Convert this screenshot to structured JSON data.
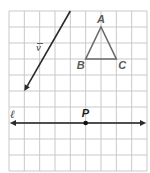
{
  "figure": {
    "grid": {
      "columns": 9,
      "rows": 10
    },
    "vector": {
      "label": "v",
      "tail": [
        4,
        0
      ],
      "head": [
        1,
        5
      ]
    },
    "triangle": {
      "vertices": [
        {
          "name": "A",
          "point": [
            6,
            1
          ]
        },
        {
          "name": "B",
          "point": [
            5,
            3
          ]
        },
        {
          "name": "C",
          "point": [
            7,
            3
          ]
        }
      ]
    },
    "line": {
      "label": "ℓ",
      "row": 7,
      "point": {
        "name": "P",
        "point": [
          5,
          7
        ]
      }
    },
    "colors": {
      "grid": "#c9c9c9",
      "vector": "#2a2a2a",
      "triangle": "#6b6b6b",
      "line": "#1e1e1e"
    }
  }
}
